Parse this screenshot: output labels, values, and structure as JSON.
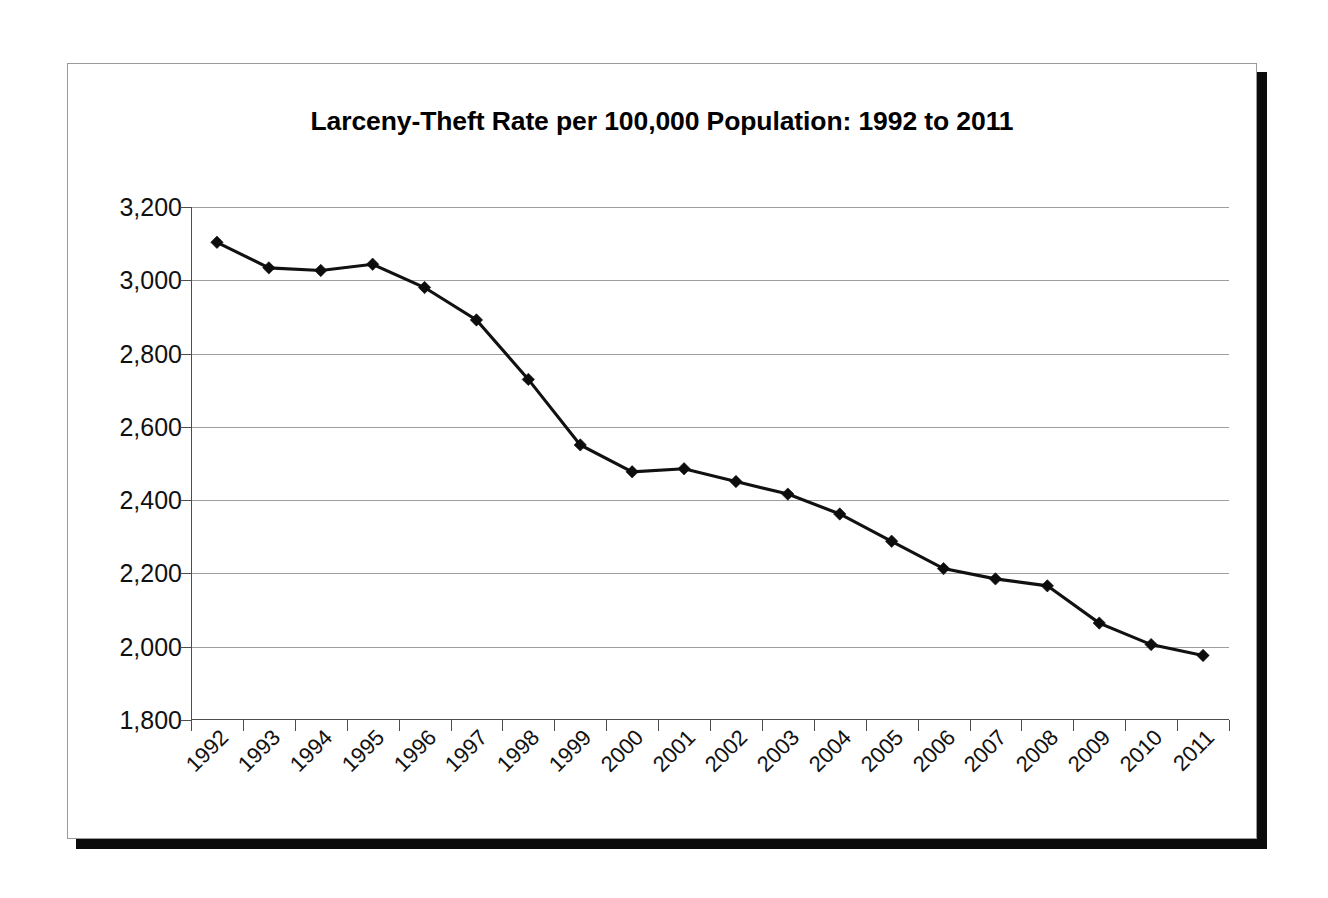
{
  "figure": {
    "title": "Larceny-Theft Rate per 100,000 Population: 1992 to 2011",
    "background_color": "#ffffff",
    "frame_border_color": "#9a9a9a",
    "shadow_color": "#0b0b0b"
  },
  "chart_data": {
    "type": "line",
    "title": "Larceny-Theft Rate per 100,000 Population: 1992 to 2011",
    "xlabel": "",
    "ylabel": "",
    "categories": [
      "1992",
      "1993",
      "1994",
      "1995",
      "1996",
      "1997",
      "1998",
      "1999",
      "2000",
      "2001",
      "2002",
      "2003",
      "2004",
      "2005",
      "2006",
      "2007",
      "2008",
      "2009",
      "2010",
      "2011"
    ],
    "values": [
      3103.6,
      3033.9,
      3026.9,
      3043.8,
      2980.3,
      2891.8,
      2729.5,
      2550.7,
      2477.3,
      2485.7,
      2450.7,
      2416.5,
      2362.3,
      2287.8,
      2213.2,
      2185.2,
      2166.1,
      2064.5,
      2005.8,
      1976.2
    ],
    "series": [
      {
        "name": "Larceny-Theft Rate",
        "color": "#111111",
        "marker": "diamond",
        "values": [
          3103.6,
          3033.9,
          3026.9,
          3043.8,
          2980.3,
          2891.8,
          2729.5,
          2550.7,
          2477.3,
          2485.7,
          2450.7,
          2416.5,
          2362.3,
          2287.8,
          2213.2,
          2185.2,
          2166.1,
          2064.5,
          2005.8,
          1976.2
        ]
      }
    ],
    "ylim": [
      1800,
      3200
    ],
    "ytick_labels": [
      "3,200",
      "3,000",
      "2,800",
      "2,600",
      "2,400",
      "2,200",
      "2,000",
      "1,800"
    ],
    "ytick_values": [
      3200,
      3000,
      2800,
      2600,
      2400,
      2200,
      2000,
      1800
    ],
    "grid": true,
    "grid_color": "#9f9f9f",
    "legend": false,
    "legend_position": "none",
    "xtick_rotation": -45
  }
}
